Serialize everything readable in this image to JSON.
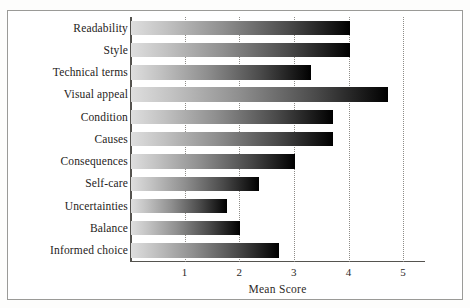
{
  "chart_data": {
    "type": "bar",
    "orientation": "horizontal",
    "title": "",
    "xlabel": "Mean Score",
    "ylabel": "",
    "xlim": [
      0,
      5.4
    ],
    "xticks": [
      "1",
      "2",
      "3",
      "4",
      "5"
    ],
    "xtick_values": [
      1,
      2,
      3,
      4,
      5
    ],
    "grid": "vertical dotted gridlines at each x tick",
    "legend": "none",
    "bar_style": "grayscale gradient, light gray at axis to black at bar end",
    "categories": [
      "Readability",
      "Style",
      "Technical terms",
      "Visual appeal",
      "Condition",
      "Causes",
      "Consequences",
      "Self-care",
      "Uncertainties",
      "Balance",
      "Informed choice"
    ],
    "values": [
      4.0,
      4.0,
      3.3,
      4.7,
      3.7,
      3.7,
      3.0,
      2.35,
      1.75,
      2.0,
      2.7
    ]
  }
}
